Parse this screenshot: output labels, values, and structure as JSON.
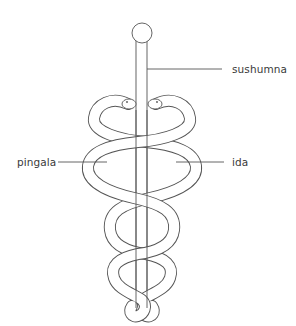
{
  "diagram": {
    "type": "caduceus-energy-channels",
    "colors": {
      "stroke": "#555555",
      "text": "#3a3a3a",
      "background": "#ffffff"
    },
    "labels": [
      {
        "id": "sushumna",
        "text": "sushumna",
        "side": "right"
      },
      {
        "id": "pingala",
        "text": "pingala",
        "side": "left"
      },
      {
        "id": "ida",
        "text": "ida",
        "side": "right"
      }
    ],
    "elements": [
      "staff",
      "knob",
      "left-serpent",
      "right-serpent"
    ]
  }
}
